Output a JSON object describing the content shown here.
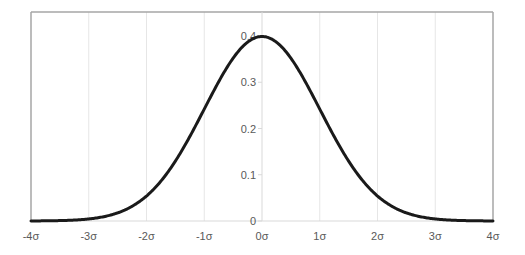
{
  "chart_data": {
    "type": "line",
    "title": "",
    "xlabel": "",
    "ylabel": "",
    "series": [
      {
        "name": "Standard normal PDF",
        "color": "#1a1a1a",
        "function": "normal_pdf",
        "mean": 0,
        "sd": 1,
        "x": [
          -4,
          -3.5,
          -3,
          -2.5,
          -2,
          -1.5,
          -1,
          -0.5,
          0,
          0.5,
          1,
          1.5,
          2,
          2.5,
          3,
          3.5,
          4
        ],
        "values": [
          0.0001,
          0.0009,
          0.0044,
          0.0175,
          0.054,
          0.1295,
          0.242,
          0.3521,
          0.3989,
          0.3521,
          0.242,
          0.1295,
          0.054,
          0.0175,
          0.0044,
          0.0009,
          0.0001
        ]
      }
    ],
    "x_ticks": [
      -4,
      -3,
      -2,
      -1,
      0,
      1,
      2,
      3,
      4
    ],
    "x_tick_labels": [
      "-4σ",
      "-3σ",
      "-2σ",
      "-1σ",
      "0σ",
      "1σ",
      "2σ",
      "3σ",
      "4σ"
    ],
    "y_ticks": [
      0,
      0.1,
      0.2,
      0.3,
      0.4
    ],
    "y_tick_labels": [
      "0",
      "0.1",
      "0.2",
      "0.3",
      "0.4"
    ],
    "xlim": [
      -4,
      4
    ],
    "ylim": [
      0,
      0.45
    ],
    "grid": {
      "vertical": true,
      "horizontal": false,
      "color": "#e6e6e6"
    },
    "legend": "none",
    "colors": {
      "curve": "#1a1a1a",
      "frame": "#a6a6a6",
      "axis": "#d9d9d9",
      "label": "#595959"
    }
  }
}
